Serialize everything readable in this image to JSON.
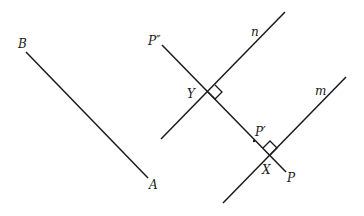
{
  "diagram": {
    "segments": [
      {
        "name": "segment-BA",
        "x1": 26,
        "y1": 52,
        "x2": 148,
        "y2": 178
      },
      {
        "name": "transversal-P-double-prime-to-P",
        "x1": 162,
        "y1": 45,
        "x2": 286,
        "y2": 172
      },
      {
        "name": "line-n",
        "x1": 161,
        "y1": 139,
        "x2": 285,
        "y2": 12
      },
      {
        "name": "line-m",
        "x1": 223,
        "y1": 203,
        "x2": 346,
        "y2": 77
      }
    ],
    "labels": {
      "B": "B",
      "A": "A",
      "P_double_prime": "P″",
      "n": "n",
      "m": "m",
      "Y": "Y",
      "P_prime": "P′",
      "X": "X",
      "P": "P"
    },
    "right_angles": [
      {
        "at": "Y",
        "x": 208,
        "y": 92
      },
      {
        "at": "X",
        "x": 270,
        "y": 155
      }
    ],
    "colors": {
      "stroke": "#1a1a1a",
      "background": "#ffffff"
    }
  }
}
